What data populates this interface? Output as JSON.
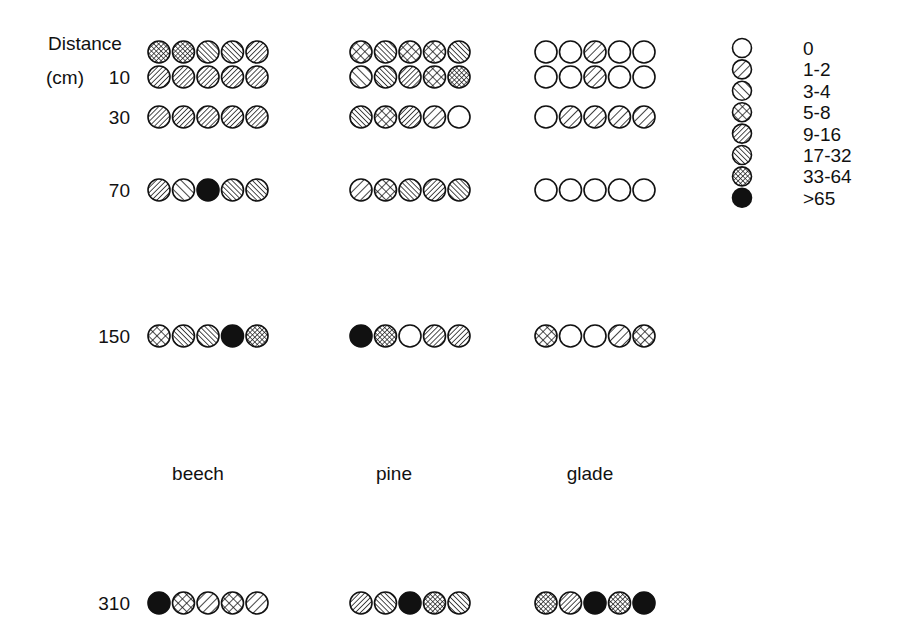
{
  "chart_data": {
    "type": "dot-matrix",
    "title": "",
    "ylabel": "Distance (cm)",
    "ylabel_line1": "Distance",
    "ylabel_line2": "(cm)",
    "distances": [
      "",
      "10",
      "30",
      "70",
      "150",
      "310"
    ],
    "groups": [
      "beech",
      "pine",
      "glade"
    ],
    "legend": {
      "position": "top-right",
      "categories": [
        "0",
        "1-2",
        "3-4",
        "5-8",
        "9-16",
        "17-32",
        "33-64",
        ">65"
      ]
    },
    "series": [
      {
        "name": "beech",
        "rows": [
          [
            "33-64",
            "33-64",
            "17-32",
            "17-32",
            "9-16"
          ],
          [
            "9-16",
            "9-16",
            "9-16",
            "9-16",
            "9-16"
          ],
          [
            "9-16",
            "9-16",
            "9-16",
            "9-16",
            "9-16"
          ],
          [
            "9-16",
            "3-4",
            ">65",
            "17-32",
            "17-32"
          ],
          [
            "5-8",
            "17-32",
            "17-32",
            ">65",
            "33-64"
          ],
          [
            ">65",
            "5-8",
            "1-2",
            "5-8",
            "1-2"
          ]
        ]
      },
      {
        "name": "pine",
        "rows": [
          [
            "5-8",
            "17-32",
            "5-8",
            "5-8",
            "17-32"
          ],
          [
            "3-4",
            "17-32",
            "9-16",
            "5-8",
            "33-64"
          ],
          [
            "17-32",
            "5-8",
            "9-16",
            "1-2",
            "0"
          ],
          [
            "1-2",
            "5-8",
            "17-32",
            "9-16",
            "17-32"
          ],
          [
            ">65",
            "33-64",
            "0",
            "9-16",
            "9-16"
          ],
          [
            "9-16",
            "17-32",
            ">65",
            "33-64",
            "17-32"
          ]
        ]
      },
      {
        "name": "glade",
        "rows": [
          [
            "0",
            "0",
            "1-2",
            "0",
            "0"
          ],
          [
            "0",
            "0",
            "1-2",
            "0",
            "0"
          ],
          [
            "0",
            "1-2",
            "1-2",
            "1-2",
            "1-2"
          ],
          [
            "0",
            "0",
            "0",
            "0",
            "0"
          ],
          [
            "5-8",
            "0",
            "0",
            "1-2",
            "5-8"
          ],
          [
            "33-64",
            "9-16",
            ">65",
            "33-64",
            ">65"
          ]
        ]
      }
    ]
  }
}
